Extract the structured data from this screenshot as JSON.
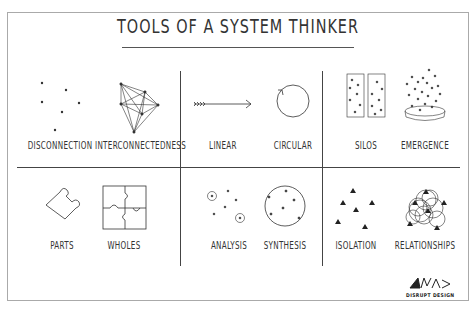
{
  "title": "TOOLS OF A SYSTEM THINKER",
  "cells": [
    {
      "id": "disconnection",
      "label": "DISCONNECTION"
    },
    {
      "id": "interconnectedness",
      "label": "INTERCONNECTEDNESS"
    },
    {
      "id": "linear",
      "label": "LINEAR"
    },
    {
      "id": "circular",
      "label": "CIRCULAR"
    },
    {
      "id": "silos",
      "label": "SILOS"
    },
    {
      "id": "emergence",
      "label": "EMERGENCE"
    },
    {
      "id": "parts",
      "label": "PARTS"
    },
    {
      "id": "wholes",
      "label": "WHOLES"
    },
    {
      "id": "analysis",
      "label": "ANALYSIS"
    },
    {
      "id": "synthesis",
      "label": "SYNTHESIS"
    },
    {
      "id": "isolation",
      "label": "ISOLATION"
    },
    {
      "id": "relationships",
      "label": "RELATIONSHIPS"
    }
  ],
  "logo": {
    "text": "DISRUPT DESIGN"
  },
  "colors": {
    "ink": "#333333",
    "frame": "#aaaaaa"
  }
}
